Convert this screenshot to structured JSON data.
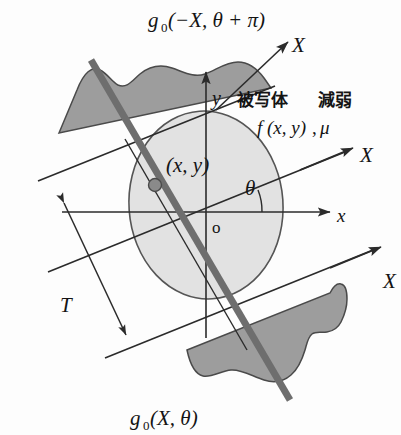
{
  "figure": {
    "title_semantic": "ct-projection-geometry-diagram",
    "background_color": "#fdfdfd",
    "line_color": "#2b2b2b",
    "object_fill": "#e2e2e2",
    "object_stroke": "#555555",
    "profile_fill": "#9d9d9d",
    "profile_stroke": "#4a4a4a",
    "ray_fill": "#6e6e6e",
    "point_fill": "#8a8a8a",
    "text_color": "#141414"
  },
  "labels": {
    "projection_top": {
      "base": "g",
      "subscript": "0",
      "args": "(−X, θ + π)",
      "full": "g₀(−X, θ + π)"
    },
    "projection_bottom": {
      "base": "g",
      "subscript": "0",
      "args": "(X, θ)",
      "full": "g₀(X, θ)"
    },
    "axis_x_upper": "X",
    "axis_x_middle": "X",
    "axis_x_lower": "X",
    "axis_x_cartesian": "x",
    "axis_y_cartesian": "y",
    "origin": "o",
    "angle": "θ",
    "point": "(x, y)",
    "thickness": "T",
    "object_jp": "被写体",
    "attenuation_jp": "減弱",
    "density_function": "f (x, y)",
    "attenuation_symbol": "μ",
    "density_separator": ","
  },
  "geometry": {
    "origin": {
      "x": 206,
      "y": 212
    },
    "object_ellipse": {
      "cx": 206,
      "cy": 205,
      "rx": 77,
      "ry": 94,
      "rotation_deg": -4
    },
    "projection_angle_deg": 22,
    "thickness_T_label_position": {
      "x": 68,
      "y": 300
    }
  },
  "icons": {
    "arrow_head": "arrow-head-icon",
    "sample_point": "sample-point-dot-icon"
  }
}
